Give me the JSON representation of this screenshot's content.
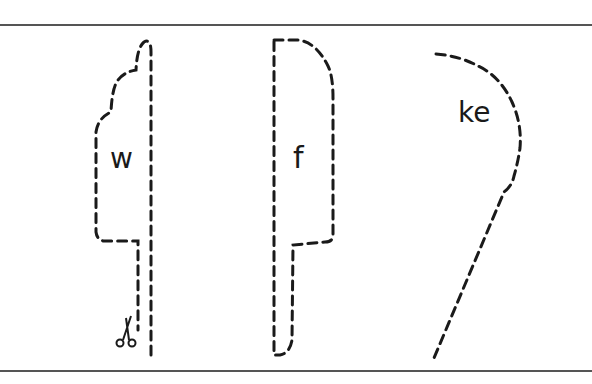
{
  "worksheet": {
    "pieces": [
      {
        "id": "piece-w",
        "label": "w",
        "shape": "cloud-top handle"
      },
      {
        "id": "piece-f",
        "label": "f",
        "shape": "rounded rectangle handle"
      },
      {
        "id": "piece-ke",
        "label": "ke",
        "shape": "curved teardrop"
      }
    ],
    "icons": {
      "scissors": "✂"
    },
    "colors": {
      "line": "#1a1a1a",
      "rule": "#555555",
      "background": "#ffffff"
    }
  }
}
